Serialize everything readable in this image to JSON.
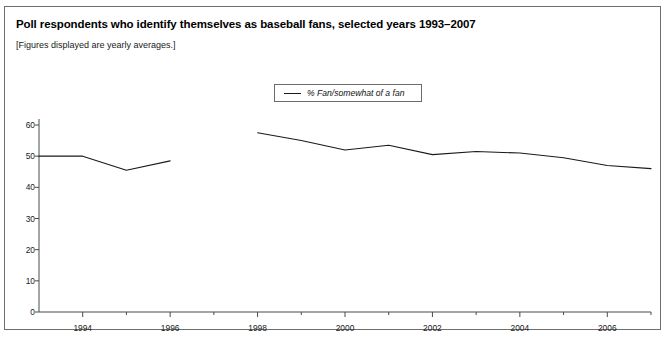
{
  "figure": {
    "title": "Poll respondents who identify themselves as baseball fans, selected years 1993–2007",
    "subtitle": "[Figures displayed are yearly averages.]",
    "border_color": "#6e6e6e",
    "background": "#ffffff"
  },
  "legend": {
    "position": "top-center",
    "entries": [
      {
        "label": "% Fan/somewhat of a fan",
        "color": "#1a1a1a"
      }
    ]
  },
  "chart_data": {
    "type": "line",
    "title": "Poll respondents who identify themselves as baseball fans, selected years 1993–2007",
    "subtitle": "[Figures displayed are yearly averages.]",
    "xlabel": "",
    "ylabel": "",
    "xlim": [
      1993,
      2007
    ],
    "ylim": [
      0,
      60
    ],
    "yticks": [
      0,
      10,
      20,
      30,
      40,
      50,
      60
    ],
    "ytick_labels": [
      "0",
      "10",
      "20",
      "30",
      "40",
      "50",
      "60"
    ],
    "xticks": [
      1994,
      1995,
      1996,
      1997,
      1998,
      1999,
      2000,
      2001,
      2002,
      2003,
      2004,
      2005,
      2006,
      2007
    ],
    "xtick_labels_major": [
      "1994",
      "1996",
      "1998",
      "2000",
      "2002",
      "2004",
      "2006"
    ],
    "xticks_major": [
      1994,
      1996,
      1998,
      2000,
      2002,
      2004,
      2006
    ],
    "grid": false,
    "legend_position": "top-center",
    "series": [
      {
        "name": "% Fan/somewhat of a fan",
        "color": "#1a1a1a",
        "x": [
          1993,
          1994,
          1995,
          1996,
          1998,
          1999,
          2000,
          2001,
          2002,
          2003,
          2004,
          2005,
          2006,
          2007
        ],
        "values": [
          50,
          50,
          45.5,
          48.5,
          57.5,
          55,
          52,
          53.5,
          50.5,
          51.5,
          51,
          49.5,
          47,
          46
        ],
        "gaps": [
          1997
        ]
      }
    ]
  }
}
